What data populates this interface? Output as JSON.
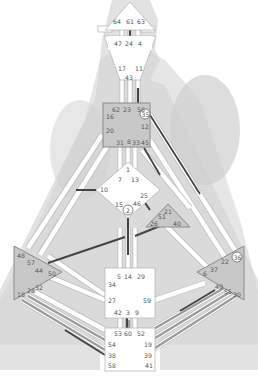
{
  "colors": {
    "background": "#ffffff",
    "silhouette_outer": "#e2e2e2",
    "silhouette_inner": "#d2d2d2",
    "channel_track": "#ffffff",
    "channel_border": "#bcbcbc",
    "active_dark": "#444444",
    "active_grey": "#9a9a9a",
    "defined_center": "#c8c8c8",
    "open_center": "#ffffff",
    "gate_text": "#555555"
  },
  "centers": {
    "head": {
      "defined": false,
      "gates": [
        "64",
        "61",
        "63"
      ]
    },
    "ajna": {
      "defined": false,
      "gates": [
        "47",
        "24",
        "4",
        "17",
        "11",
        "43"
      ]
    },
    "throat": {
      "defined": true,
      "gates": [
        "62",
        "23",
        "56",
        "16",
        "35",
        "20",
        "12",
        "31",
        "8",
        "33",
        "45"
      ],
      "circled": [
        "35"
      ]
    },
    "g": {
      "defined": false,
      "gates": [
        "1",
        "7",
        "13",
        "10",
        "25",
        "15",
        "2",
        "46"
      ],
      "circled": [
        "2"
      ]
    },
    "heart": {
      "defined": true,
      "gates": [
        "21",
        "51",
        "26",
        "40"
      ]
    },
    "spleen": {
      "defined": true,
      "gates": [
        "48",
        "57",
        "44",
        "50",
        "18",
        "28",
        "32"
      ]
    },
    "solar_plexus": {
      "defined": true,
      "gates": [
        "36",
        "22",
        "37",
        "6",
        "49",
        "55",
        "30"
      ],
      "circled": [
        "36"
      ]
    },
    "sacral": {
      "defined": false,
      "gates": [
        "5",
        "14",
        "29",
        "34",
        "27",
        "59",
        "42",
        "3",
        "9"
      ]
    },
    "root": {
      "defined": false,
      "gates": [
        "53",
        "60",
        "52",
        "54",
        "19",
        "38",
        "39",
        "58",
        "41"
      ]
    }
  },
  "labels": {
    "g64": "64",
    "g61": "61",
    "g63": "63",
    "g47": "47",
    "g24": "24",
    "g4": "4",
    "g17": "17",
    "g11": "11",
    "g43": "43",
    "g62": "62",
    "g23": "23",
    "g56": "56",
    "g16": "16",
    "g35": "35",
    "g20": "20",
    "g12": "12",
    "g31": "31",
    "g8": "8",
    "g33": "33",
    "g45": "45",
    "g1": "1",
    "g7": "7",
    "g13": "13",
    "g10": "10",
    "g25": "25",
    "g15": "15",
    "g2": "2",
    "g46": "46",
    "g21": "21",
    "g51": "51",
    "g26": "26",
    "g40": "40",
    "g48": "48",
    "g57": "57",
    "g44": "44",
    "g50": "50",
    "g18": "18",
    "g28": "28",
    "g32": "32",
    "g36": "36",
    "g22": "22",
    "g37": "37",
    "g6": "6",
    "g49": "49",
    "g55": "55",
    "g30": "30",
    "g5": "5",
    "g14": "14",
    "g29": "29",
    "g34": "34",
    "g27": "27",
    "g59": "59",
    "g42": "42",
    "g3": "3",
    "g9": "9",
    "g53": "53",
    "g60": "60",
    "g52": "52",
    "g54": "54",
    "g19": "19",
    "g38": "38",
    "g39": "39",
    "g58": "58",
    "g41": "41"
  },
  "active_gates": {
    "dark": [
      "61",
      "24",
      "11",
      "56",
      "45",
      "10",
      "25",
      "2",
      "26",
      "57",
      "58",
      "49",
      "3"
    ],
    "grey": [
      "54",
      "38",
      "19",
      "39",
      "41",
      "55",
      "30"
    ]
  }
}
